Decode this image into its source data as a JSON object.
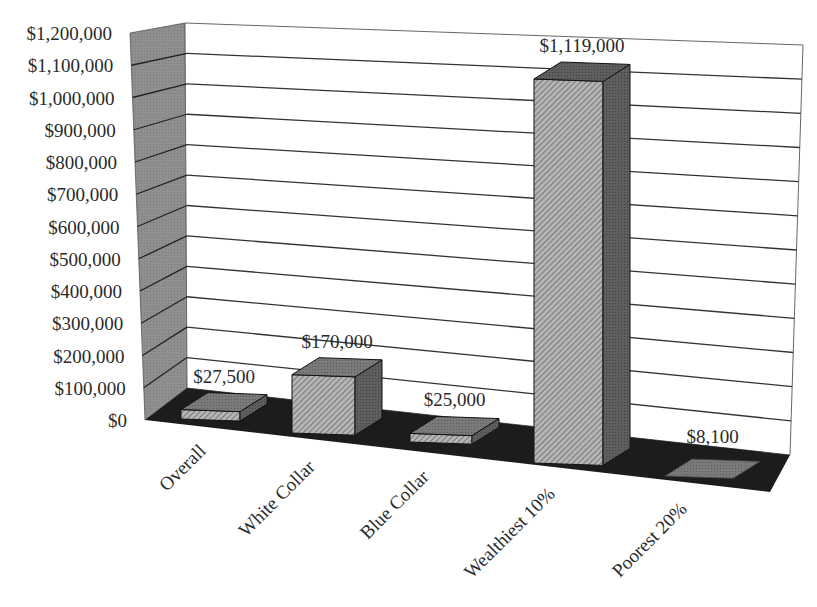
{
  "chart_data": {
    "type": "bar",
    "style": "3d-column",
    "title": "",
    "xlabel": "",
    "ylabel": "",
    "categories": [
      "Overall",
      "White Collar",
      "Blue Collar",
      "Wealthiest 10%",
      "Poorest 20%"
    ],
    "values": [
      27500,
      170000,
      25000,
      1119000,
      8100
    ],
    "data_labels": [
      "$27,500",
      "$170,000",
      "$25,000",
      "$1,119,000",
      "$8,100"
    ],
    "ylim": [
      0,
      1200000
    ],
    "yticks": [
      0,
      100000,
      200000,
      300000,
      400000,
      500000,
      600000,
      700000,
      800000,
      900000,
      1000000,
      1100000,
      1200000
    ],
    "ytick_labels": [
      "$0",
      "$100,000",
      "$200,000",
      "$300,000",
      "$400,000",
      "$500,000",
      "$600,000",
      "$700,000",
      "$800,000",
      "$900,000",
      "$1,000,000",
      "$1,100,000",
      "$1,200,000"
    ],
    "grid": true,
    "legend": "none",
    "colors": {
      "side_wall": "#8c8c8c",
      "floor": "#1c1c1c",
      "bar_front": "#a8a8a8",
      "bar_top": "#6e6e6e",
      "bar_side": "#555555",
      "grid": "#333333"
    }
  }
}
